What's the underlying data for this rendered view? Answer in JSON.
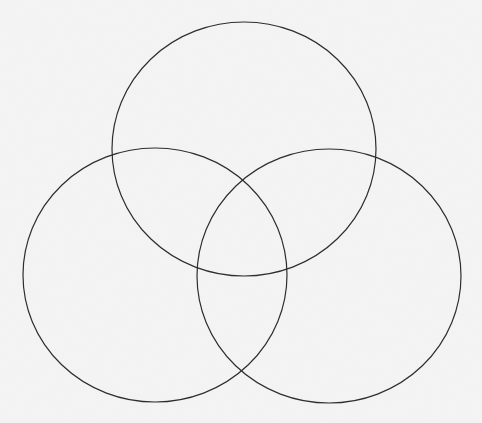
{
  "diagram": {
    "type": "venn",
    "set_count": 3,
    "labels": [],
    "background_color": "#f5f5f5",
    "stroke_color": "#2e2e2e",
    "stroke_width": 1.2,
    "circles": [
      {
        "name": "top",
        "cx": 244,
        "cy": 149,
        "rx": 132,
        "ry": 127
      },
      {
        "name": "left",
        "cx": 155,
        "cy": 275,
        "rx": 132,
        "ry": 127
      },
      {
        "name": "right",
        "cx": 329,
        "cy": 276,
        "rx": 132,
        "ry": 127
      }
    ]
  }
}
